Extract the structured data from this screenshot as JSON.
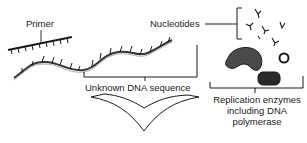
{
  "diagram": {
    "labels": {
      "primer": "Primer",
      "nucleotides": "Nucleotides",
      "unknown_dna": "Unknown DNA sequence",
      "enzymes_line1": "Replication enzymes",
      "enzymes_line2": "including DNA",
      "enzymes_line3": "polymerase"
    },
    "components": [
      {
        "id": "primer",
        "label": "Primer",
        "shape": "short strand with ticks"
      },
      {
        "id": "template-dna",
        "label": "Unknown DNA sequence",
        "shape": "wavy strand"
      },
      {
        "id": "nucleotides",
        "label": "Nucleotides",
        "shape": "small Y-shaped glyphs",
        "count": 6
      },
      {
        "id": "enzymes",
        "label": "Replication enzymes including DNA polymerase",
        "shape": "blobs",
        "count": 3
      }
    ],
    "arrow": {
      "direction": "down",
      "style": "open chevron"
    },
    "colors": {
      "ink": "#1a1a1a",
      "background": "#ffffff",
      "blob_fill": "#3a3a3a"
    }
  }
}
